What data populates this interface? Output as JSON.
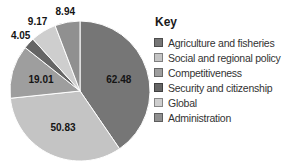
{
  "chart_data": {
    "type": "pie",
    "title": "",
    "legend_title": "Key",
    "legend_position": "right",
    "direction": "clockwise",
    "start_angle_deg": 0,
    "total": 154.48,
    "value_label_format": "2-decimals",
    "separator_color": "#ffffff",
    "background_color": "#ffffff",
    "slices": [
      {
        "label": "Agriculture and fisheries",
        "value": 62.48,
        "display_value": "62.48",
        "color": "#767676",
        "label_placement": "inside"
      },
      {
        "label": "Social and regional policy",
        "value": 50.83,
        "display_value": "50.83",
        "color": "#c4c4c4",
        "label_placement": "inside"
      },
      {
        "label": "Competitiveness",
        "value": 19.01,
        "display_value": "19.01",
        "color": "#9e9e9e",
        "label_placement": "inside"
      },
      {
        "label": "Security and citizenship",
        "value": 4.05,
        "display_value": "4.05",
        "color": "#656565",
        "label_placement": "outside"
      },
      {
        "label": "Global",
        "value": 9.17,
        "display_value": "9.17",
        "color": "#cecece",
        "label_placement": "outside"
      },
      {
        "label": "Administration",
        "value": 8.94,
        "display_value": "8.94",
        "color": "#909090",
        "label_placement": "outside"
      }
    ]
  }
}
